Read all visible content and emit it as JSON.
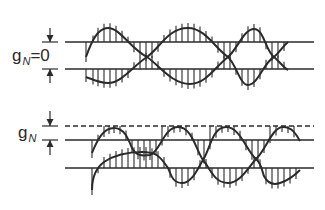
{
  "panels": [
    {
      "id": "top",
      "label_main": "g",
      "label_sub": "N",
      "label_suffix": "=0",
      "label_pos": [
        12,
        47
      ],
      "arrow_x": 50,
      "arrows": [
        {
          "from": 28,
          "to": 42
        },
        {
          "from": 83,
          "to": 69
        }
      ],
      "lines": [
        {
          "y": 42,
          "x1": 65,
          "x2": 314,
          "style": "solid"
        },
        {
          "y": 69,
          "x1": 65,
          "x2": 314,
          "style": "solid"
        }
      ],
      "upper_curve": "M86,57 C92,40 98,28 108,28 C120,28 130,48 147,57 C160,48 168,28 188,28 C205,28 215,48 228,57 C238,48 244,29 254,29 C264,29 266,52 274,57 C280,52 283,46 288,42",
      "lower_curve": "M86,77 C94,80 100,83 108,83 C122,83 134,65 147,57 C160,66 172,84 190,84 C206,84 216,66 228,57 C236,64 240,85 248,85 C258,85 264,62 274,57 C280,62 284,68 288,70",
      "upper_ticks": [
        {
          "x": 86,
          "ref": 42
        },
        {
          "x": 93,
          "ref": 42
        },
        {
          "x": 98,
          "ref": 42
        },
        {
          "x": 104,
          "ref": 42
        },
        {
          "x": 110,
          "ref": 42
        },
        {
          "x": 116,
          "ref": 42
        },
        {
          "x": 122,
          "ref": 42
        },
        {
          "x": 128,
          "ref": 42
        },
        {
          "x": 134,
          "ref": 42
        },
        {
          "x": 140,
          "ref": 42
        },
        {
          "x": 146,
          "ref": 42
        },
        {
          "x": 152,
          "ref": 42
        },
        {
          "x": 158,
          "ref": 42
        },
        {
          "x": 164,
          "ref": 42
        },
        {
          "x": 170,
          "ref": 42
        },
        {
          "x": 176,
          "ref": 42
        },
        {
          "x": 182,
          "ref": 42
        },
        {
          "x": 188,
          "ref": 42
        },
        {
          "x": 194,
          "ref": 42
        },
        {
          "x": 200,
          "ref": 42
        },
        {
          "x": 206,
          "ref": 42
        },
        {
          "x": 212,
          "ref": 42
        },
        {
          "x": 218,
          "ref": 42
        },
        {
          "x": 224,
          "ref": 42
        },
        {
          "x": 230,
          "ref": 42
        },
        {
          "x": 236,
          "ref": 42
        },
        {
          "x": 242,
          "ref": 42
        },
        {
          "x": 248,
          "ref": 42
        },
        {
          "x": 254,
          "ref": 42
        },
        {
          "x": 260,
          "ref": 42
        },
        {
          "x": 266,
          "ref": 42
        },
        {
          "x": 272,
          "ref": 42
        },
        {
          "x": 278,
          "ref": 42
        },
        {
          "x": 284,
          "ref": 42
        }
      ],
      "lower_ticks": [
        {
          "x": 86,
          "ref": 69
        },
        {
          "x": 93,
          "ref": 69
        },
        {
          "x": 98,
          "ref": 69
        },
        {
          "x": 104,
          "ref": 69
        },
        {
          "x": 110,
          "ref": 69
        },
        {
          "x": 116,
          "ref": 69
        },
        {
          "x": 122,
          "ref": 69
        },
        {
          "x": 128,
          "ref": 69
        },
        {
          "x": 134,
          "ref": 69
        },
        {
          "x": 140,
          "ref": 69
        },
        {
          "x": 146,
          "ref": 69
        },
        {
          "x": 152,
          "ref": 69
        },
        {
          "x": 158,
          "ref": 69
        },
        {
          "x": 164,
          "ref": 69
        },
        {
          "x": 170,
          "ref": 69
        },
        {
          "x": 176,
          "ref": 69
        },
        {
          "x": 182,
          "ref": 69
        },
        {
          "x": 188,
          "ref": 69
        },
        {
          "x": 194,
          "ref": 69
        },
        {
          "x": 200,
          "ref": 69
        },
        {
          "x": 206,
          "ref": 69
        },
        {
          "x": 212,
          "ref": 69
        },
        {
          "x": 218,
          "ref": 69
        },
        {
          "x": 224,
          "ref": 69
        },
        {
          "x": 230,
          "ref": 69
        },
        {
          "x": 236,
          "ref": 69
        },
        {
          "x": 242,
          "ref": 69
        },
        {
          "x": 248,
          "ref": 69
        },
        {
          "x": 254,
          "ref": 69
        },
        {
          "x": 260,
          "ref": 69
        },
        {
          "x": 266,
          "ref": 69
        },
        {
          "x": 272,
          "ref": 69
        },
        {
          "x": 278,
          "ref": 69
        },
        {
          "x": 284,
          "ref": 69
        }
      ]
    },
    {
      "id": "bottom",
      "label_main": "g",
      "label_sub": "N",
      "label_suffix": "",
      "label_pos": [
        18,
        124
      ],
      "arrow_x": 50,
      "arrows": [
        {
          "from": 111,
          "to": 126
        },
        {
          "from": 155,
          "to": 140
        }
      ],
      "lines": [
        {
          "y": 126,
          "x1": 65,
          "x2": 314,
          "style": "dashed"
        },
        {
          "y": 140,
          "x1": 65,
          "x2": 314,
          "style": "solid"
        },
        {
          "y": 168,
          "x1": 65,
          "x2": 314,
          "style": "solid"
        }
      ],
      "upper_curve": "M92,153 C98,138 104,128 114,128 C124,128 128,138 132,148 C136,156 142,156 150,155 C160,152 164,127 178,127 C192,127 196,150 203,160 C210,150 212,127 226,127 C240,127 246,150 256,159 C266,150 272,127 283,127 C292,127 296,134 300,141",
      "lower_curve": "M92,190 C92,178 96,168 104,162 C116,154 130,152 142,152 C156,152 160,156 168,168 C172,178 174,183 182,183 C192,183 198,168 203,160 C210,168 214,183 228,183 C240,183 248,168 256,159 C262,164 262,172 264,176 C268,184 274,185 280,183 C290,180 296,174 300,170",
      "upper_ticks": [
        {
          "x": 92,
          "ref": 140
        },
        {
          "x": 98,
          "ref": 140
        },
        {
          "x": 104,
          "ref": 126
        },
        {
          "x": 109,
          "ref": 126
        },
        {
          "x": 114,
          "ref": 126
        },
        {
          "x": 120,
          "ref": 126
        },
        {
          "x": 126,
          "ref": 140
        },
        {
          "x": 132,
          "ref": 140
        },
        {
          "x": 138,
          "ref": 140
        },
        {
          "x": 144,
          "ref": 140
        },
        {
          "x": 150,
          "ref": 140
        },
        {
          "x": 156,
          "ref": 140
        },
        {
          "x": 162,
          "ref": 126
        },
        {
          "x": 168,
          "ref": 126
        },
        {
          "x": 174,
          "ref": 126
        },
        {
          "x": 180,
          "ref": 126
        },
        {
          "x": 186,
          "ref": 126
        },
        {
          "x": 192,
          "ref": 140
        },
        {
          "x": 198,
          "ref": 140
        },
        {
          "x": 204,
          "ref": 140
        },
        {
          "x": 210,
          "ref": 126
        },
        {
          "x": 216,
          "ref": 126
        },
        {
          "x": 222,
          "ref": 126
        },
        {
          "x": 228,
          "ref": 126
        },
        {
          "x": 234,
          "ref": 126
        },
        {
          "x": 240,
          "ref": 140
        },
        {
          "x": 246,
          "ref": 140
        },
        {
          "x": 252,
          "ref": 140
        },
        {
          "x": 258,
          "ref": 140
        },
        {
          "x": 264,
          "ref": 140
        },
        {
          "x": 270,
          "ref": 126
        },
        {
          "x": 276,
          "ref": 126
        },
        {
          "x": 282,
          "ref": 126
        },
        {
          "x": 288,
          "ref": 126
        },
        {
          "x": 294,
          "ref": 126
        }
      ],
      "lower_ticks": [
        {
          "x": 92,
          "ref": 168
        },
        {
          "x": 98,
          "ref": 168
        },
        {
          "x": 104,
          "ref": 168
        },
        {
          "x": 110,
          "ref": 168
        },
        {
          "x": 116,
          "ref": 168
        },
        {
          "x": 122,
          "ref": 168
        },
        {
          "x": 128,
          "ref": 168
        },
        {
          "x": 134,
          "ref": 168
        },
        {
          "x": 140,
          "ref": 168
        },
        {
          "x": 146,
          "ref": 168
        },
        {
          "x": 152,
          "ref": 168
        },
        {
          "x": 158,
          "ref": 168
        },
        {
          "x": 164,
          "ref": 168
        },
        {
          "x": 170,
          "ref": 168
        },
        {
          "x": 176,
          "ref": 168
        },
        {
          "x": 182,
          "ref": 168
        },
        {
          "x": 188,
          "ref": 168
        },
        {
          "x": 194,
          "ref": 168
        },
        {
          "x": 200,
          "ref": 168
        },
        {
          "x": 206,
          "ref": 168
        },
        {
          "x": 212,
          "ref": 168
        },
        {
          "x": 218,
          "ref": 168
        },
        {
          "x": 224,
          "ref": 168
        },
        {
          "x": 230,
          "ref": 168
        },
        {
          "x": 236,
          "ref": 168
        },
        {
          "x": 242,
          "ref": 168
        },
        {
          "x": 248,
          "ref": 168
        },
        {
          "x": 254,
          "ref": 168
        },
        {
          "x": 260,
          "ref": 168
        },
        {
          "x": 266,
          "ref": 168
        },
        {
          "x": 272,
          "ref": 168
        },
        {
          "x": 278,
          "ref": 168
        },
        {
          "x": 284,
          "ref": 168
        },
        {
          "x": 290,
          "ref": 168
        },
        {
          "x": 296,
          "ref": 168
        }
      ]
    }
  ],
  "style": {
    "stroke": "#2a2a2a",
    "background": "#ffffff"
  }
}
